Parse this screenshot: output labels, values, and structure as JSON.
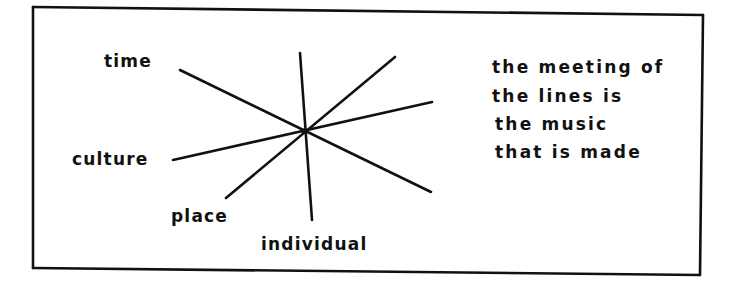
{
  "diagram": {
    "kind": "hand-drawn radial line diagram",
    "frame": {
      "corners": {
        "top_left": [
          33,
          7
        ],
        "top_right": [
          703,
          15
        ],
        "bottom_right": [
          700,
          275
        ],
        "bottom_left": [
          33,
          268
        ]
      },
      "stroke": "#111111"
    },
    "center": [
      304,
      131
    ],
    "lines": [
      {
        "name": "time",
        "from": [
          180,
          70
        ],
        "to": [
          431,
          192
        ]
      },
      {
        "name": "culture",
        "from": [
          173,
          160
        ],
        "to": [
          432,
          102
        ]
      },
      {
        "name": "place",
        "from": [
          226,
          198
        ],
        "to": [
          395,
          57
        ]
      },
      {
        "name": "individual",
        "from": [
          300,
          53
        ],
        "to": [
          312,
          220
        ]
      }
    ],
    "labels": {
      "time": "time",
      "culture": "culture",
      "place": "place",
      "individual": "individual"
    },
    "note": {
      "lines": [
        "the meeting of",
        "the lines is",
        "the music",
        "that is made"
      ]
    }
  }
}
